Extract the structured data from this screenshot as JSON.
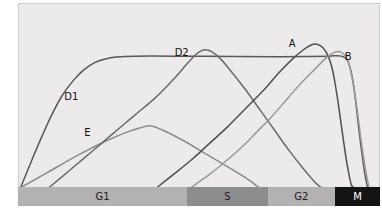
{
  "chart_data": {
    "type": "line",
    "title": "",
    "xlabel": "Cell cycle phase",
    "ylabel": "Relative amounts of cyclins",
    "grid": false,
    "legend_position": "inline-labels",
    "xlim": [
      0,
      100
    ],
    "ylim": [
      0,
      100
    ],
    "axis_ticks_shown": false,
    "phases": [
      {
        "label": "G1",
        "start": 0,
        "end": 46.7,
        "color": "#b3b1b1",
        "text_color": "#1a1a1a"
      },
      {
        "label": "S",
        "start": 46.7,
        "end": 69.0,
        "color": "#8e8d8d",
        "text_color": "#1a1a1a"
      },
      {
        "label": "G2",
        "start": 69.0,
        "end": 87.6,
        "color": "#b3b1b1",
        "text_color": "#1a1a1a"
      },
      {
        "label": "M",
        "start": 87.6,
        "end": 100,
        "color": "#141414",
        "text_color": "#ffffff"
      }
    ],
    "series": [
      {
        "name": "D1",
        "label": "D1",
        "color": "#585858",
        "label_x": 12.5,
        "label_y": 52.5,
        "points": [
          [
            0.5,
            0
          ],
          [
            3,
            12
          ],
          [
            6,
            26
          ],
          [
            9,
            39
          ],
          [
            12,
            50
          ],
          [
            15,
            58
          ],
          [
            18,
            64
          ],
          [
            21,
            68
          ],
          [
            24,
            70
          ],
          [
            27,
            71
          ],
          [
            32,
            71.5
          ],
          [
            45,
            71.5
          ],
          [
            60,
            71.3
          ],
          [
            72,
            71.2
          ],
          [
            80,
            71.3
          ],
          [
            86,
            71.5
          ],
          [
            89.5,
            71.5
          ],
          [
            91.5,
            68
          ],
          [
            93,
            55
          ],
          [
            94.5,
            30
          ],
          [
            96,
            8
          ],
          [
            96.8,
            0
          ]
        ]
      },
      {
        "name": "E",
        "label": "E",
        "color": "#8a8a8a",
        "label_x": 18,
        "label_y": 33,
        "points": [
          [
            0.8,
            0
          ],
          [
            8,
            8
          ],
          [
            16,
            17
          ],
          [
            24,
            25
          ],
          [
            30,
            30
          ],
          [
            34,
            32.5
          ],
          [
            36.5,
            33.5
          ],
          [
            40,
            31
          ],
          [
            46,
            25
          ],
          [
            52,
            18
          ],
          [
            58,
            11
          ],
          [
            63,
            5
          ],
          [
            66.5,
            0
          ]
        ]
      },
      {
        "name": "D2",
        "label": "D2",
        "color": "#6a6a6a",
        "label_x": 43,
        "label_y": 76,
        "points": [
          [
            8.5,
            0
          ],
          [
            14,
            9
          ],
          [
            20,
            19
          ],
          [
            26,
            29
          ],
          [
            32,
            39
          ],
          [
            38,
            49
          ],
          [
            43,
            59
          ],
          [
            47,
            68
          ],
          [
            49.5,
            73
          ],
          [
            51.5,
            75
          ],
          [
            53.5,
            74
          ],
          [
            56,
            70
          ],
          [
            59,
            63
          ],
          [
            63,
            53
          ],
          [
            67,
            42
          ],
          [
            71,
            31
          ],
          [
            75,
            20
          ],
          [
            79,
            10
          ],
          [
            82.5,
            2
          ],
          [
            83.8,
            0
          ]
        ]
      },
      {
        "name": "A",
        "label": "A",
        "color": "#4f4f4f",
        "label_x": 74.5,
        "label_y": 81,
        "points": [
          [
            38.5,
            0
          ],
          [
            43,
            7
          ],
          [
            48,
            15
          ],
          [
            53,
            24
          ],
          [
            58,
            33
          ],
          [
            63,
            43
          ],
          [
            68,
            53
          ],
          [
            72,
            62
          ],
          [
            76,
            70
          ],
          [
            79,
            75
          ],
          [
            81,
            77.5
          ],
          [
            82.8,
            78
          ],
          [
            84.5,
            76
          ],
          [
            86,
            71
          ],
          [
            87.3,
            62
          ],
          [
            88.5,
            48
          ],
          [
            89.8,
            30
          ],
          [
            91,
            14
          ],
          [
            92.2,
            2
          ],
          [
            92.8,
            0
          ]
        ]
      },
      {
        "name": "B",
        "label": "B",
        "color": "#9a9a9a",
        "label_x": 90,
        "label_y": 74,
        "points": [
          [
            48,
            0
          ],
          [
            53,
            7
          ],
          [
            58,
            15
          ],
          [
            62,
            22
          ],
          [
            66,
            30
          ],
          [
            70,
            38
          ],
          [
            74,
            47
          ],
          [
            78,
            56
          ],
          [
            82,
            64
          ],
          [
            85,
            70
          ],
          [
            87,
            73
          ],
          [
            88.8,
            74
          ],
          [
            90.3,
            72.5
          ],
          [
            91.5,
            68
          ],
          [
            92.6,
            59
          ],
          [
            93.8,
            44
          ],
          [
            95,
            26
          ],
          [
            96.2,
            10
          ],
          [
            97.2,
            0
          ]
        ]
      }
    ]
  },
  "axis": {
    "y_label": "Relative amounts of cyclins"
  },
  "phase_labels": {
    "g1": "G1",
    "s": "S",
    "g2": "G2",
    "m": "M"
  },
  "series_labels": {
    "d1": "D1",
    "e": "E",
    "d2": "D2",
    "a": "A",
    "b": "B"
  }
}
